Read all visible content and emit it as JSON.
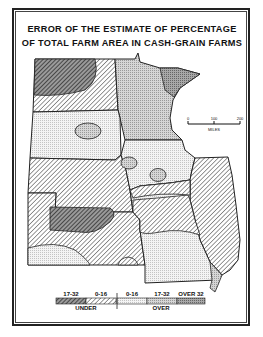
{
  "title": {
    "line1": "ERROR OF THE ESTIMATE OF PERCENTAGE",
    "line2": "OF TOTAL FARM AREA IN CASH-GRAIN FARMS"
  },
  "scale_bar": {
    "ticks": [
      "0",
      "100",
      "200"
    ],
    "unit": "MILES"
  },
  "legend": {
    "categories": [
      {
        "label": "17-32",
        "group": "UNDER",
        "pattern": "dense-hatch"
      },
      {
        "label": "0-16",
        "group": "UNDER",
        "pattern": "light-hatch"
      },
      {
        "label": "0-16",
        "group": "OVER",
        "pattern": "light-dots"
      },
      {
        "label": "17-32",
        "group": "OVER",
        "pattern": "medium-dots"
      },
      {
        "label": "OVER 32",
        "group": "OVER",
        "pattern": "dense-dots"
      }
    ],
    "group_labels": {
      "under": "UNDER",
      "over": "OVER"
    }
  },
  "colors": {
    "ink": "#222222",
    "paper": "#ffffff"
  }
}
